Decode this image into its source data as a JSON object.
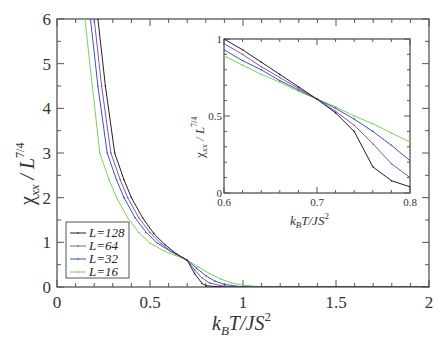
{
  "chart_data": [
    {
      "type": "line",
      "title": "",
      "xlabel": "k_B T/JS^2",
      "ylabel": "χ_xx / L^{7/4}",
      "xlim": [
        0,
        2
      ],
      "ylim": [
        0,
        6
      ],
      "xticks": [
        "0",
        "0.5",
        "1",
        "1.5",
        "2"
      ],
      "yticks": [
        "0",
        "1",
        "2",
        "3",
        "4",
        "5",
        "6"
      ],
      "grid": false,
      "legend_position": "lower-left",
      "series": [
        {
          "name": "L=128",
          "color": "#222222",
          "x": [
            0.22,
            0.26,
            0.31,
            0.36,
            0.4,
            0.46,
            0.52,
            0.58,
            0.64,
            0.7,
            0.74,
            0.78,
            0.8,
            0.85,
            0.9,
            1.0,
            1.5,
            2.0
          ],
          "y": [
            6.0,
            4.5,
            3.0,
            2.4,
            2.0,
            1.55,
            1.2,
            0.95,
            0.75,
            0.6,
            0.3,
            0.08,
            0.03,
            0.01,
            0.0,
            0.0,
            0.0,
            0.0
          ]
        },
        {
          "name": "L=64",
          "color": "#8a4fc0",
          "x": [
            0.2,
            0.24,
            0.29,
            0.34,
            0.38,
            0.44,
            0.5,
            0.56,
            0.62,
            0.7,
            0.74,
            0.78,
            0.82,
            0.88,
            0.94,
            1.0,
            1.5,
            2.0
          ],
          "y": [
            6.0,
            4.5,
            3.0,
            2.4,
            2.0,
            1.55,
            1.22,
            0.97,
            0.78,
            0.6,
            0.38,
            0.2,
            0.09,
            0.03,
            0.01,
            0.0,
            0.0,
            0.0
          ]
        },
        {
          "name": "L=32",
          "color": "#3a55b8",
          "x": [
            0.18,
            0.22,
            0.27,
            0.32,
            0.36,
            0.42,
            0.48,
            0.54,
            0.61,
            0.7,
            0.75,
            0.8,
            0.85,
            0.9,
            0.96,
            1.02,
            1.5,
            2.0
          ],
          "y": [
            6.0,
            4.5,
            3.0,
            2.4,
            2.0,
            1.55,
            1.22,
            0.98,
            0.8,
            0.6,
            0.42,
            0.25,
            0.13,
            0.06,
            0.02,
            0.0,
            0.0,
            0.0
          ]
        },
        {
          "name": "L=16",
          "color": "#7fcf5a",
          "x": [
            0.15,
            0.19,
            0.23,
            0.28,
            0.32,
            0.38,
            0.44,
            0.5,
            0.58,
            0.7,
            0.76,
            0.82,
            0.88,
            0.94,
            1.0,
            1.08,
            1.5,
            2.0
          ],
          "y": [
            6.0,
            4.5,
            3.0,
            2.4,
            2.0,
            1.55,
            1.22,
            0.98,
            0.8,
            0.6,
            0.45,
            0.3,
            0.18,
            0.09,
            0.04,
            0.01,
            0.0,
            0.0
          ]
        }
      ]
    },
    {
      "type": "line",
      "title": "inset",
      "xlabel": "k_B T/JS^2",
      "ylabel": "χ_xx / L^{7/4}",
      "xlim": [
        0.6,
        0.8
      ],
      "ylim": [
        0,
        1
      ],
      "xticks": [
        "0.6",
        "0.7",
        "0.8"
      ],
      "yticks": [
        "0",
        "0.5",
        "1"
      ],
      "grid": false,
      "series": [
        {
          "name": "L=128",
          "color": "#222222",
          "x": [
            0.6,
            0.62,
            0.64,
            0.66,
            0.68,
            0.7,
            0.72,
            0.74,
            0.76,
            0.78,
            0.8
          ],
          "y": [
            1.0,
            0.93,
            0.85,
            0.77,
            0.69,
            0.61,
            0.52,
            0.4,
            0.17,
            0.08,
            0.04
          ]
        },
        {
          "name": "L=64",
          "color": "#8a4fc0",
          "x": [
            0.6,
            0.62,
            0.64,
            0.66,
            0.68,
            0.7,
            0.72,
            0.74,
            0.76,
            0.78,
            0.8
          ],
          "y": [
            0.97,
            0.9,
            0.82,
            0.75,
            0.68,
            0.61,
            0.53,
            0.44,
            0.32,
            0.19,
            0.1
          ]
        },
        {
          "name": "L=32",
          "color": "#3a55b8",
          "x": [
            0.6,
            0.62,
            0.64,
            0.66,
            0.68,
            0.7,
            0.72,
            0.74,
            0.76,
            0.78,
            0.8
          ],
          "y": [
            0.93,
            0.86,
            0.8,
            0.73,
            0.67,
            0.61,
            0.55,
            0.48,
            0.4,
            0.31,
            0.21
          ]
        },
        {
          "name": "L=16",
          "color": "#7fcf5a",
          "x": [
            0.6,
            0.62,
            0.64,
            0.66,
            0.68,
            0.7,
            0.72,
            0.74,
            0.76,
            0.78,
            0.8
          ],
          "y": [
            0.89,
            0.83,
            0.77,
            0.72,
            0.66,
            0.61,
            0.56,
            0.5,
            0.45,
            0.39,
            0.33
          ]
        }
      ]
    }
  ],
  "legend": {
    "items": [
      {
        "label": "L=128",
        "color": "#222222"
      },
      {
        "label": "L=64",
        "color": "#8a4fc0"
      },
      {
        "label": "L=32",
        "color": "#3a55b8"
      },
      {
        "label": "L=16",
        "color": "#7fcf5a"
      }
    ]
  },
  "main": {
    "xlabel_main": "k",
    "xlabel_sub": "B",
    "xlabel_rest": "T/JS",
    "xlabel_sup": "2",
    "ylabel_chi": "χ",
    "ylabel_sub": "xx",
    "ylabel_rest": " / L",
    "ylabel_sup": "7/4"
  },
  "inset": {
    "xlabel_main": "k",
    "xlabel_sub": "B",
    "xlabel_rest": "T/JS",
    "xlabel_sup": "2",
    "ylabel_chi": "χ",
    "ylabel_sub": "xx",
    "ylabel_rest": " / L",
    "ylabel_sup": "7/4"
  }
}
